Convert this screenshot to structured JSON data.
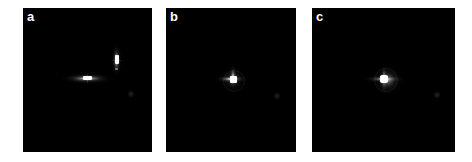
{
  "figure": {
    "kind": "multi-panel-image-figure",
    "background_color": "#ffffff",
    "panel_background_color": "#000000",
    "label_color": "#ffffff",
    "width": 472,
    "height": 162
  },
  "panels": [
    {
      "label": "a",
      "x": 23,
      "y": 8,
      "width": 129,
      "height": 144,
      "description": "Dark field with two separated bright diffraction features: a horizontal streak left-of-center and a vertical streak above-right of it",
      "features": [
        {
          "name": "horizontal-streak",
          "cx": 87,
          "cy": 78,
          "length": 52,
          "thickness": 5,
          "orientation": "horizontal",
          "peak_brightness": 1.0
        },
        {
          "name": "horizontal-streak-core",
          "cx": 88,
          "cy": 78,
          "width": 9,
          "height": 4
        },
        {
          "name": "vertical-streak",
          "cx": 116,
          "cy": 60,
          "length": 34,
          "thickness": 5,
          "orientation": "vertical",
          "peak_brightness": 1.0
        },
        {
          "name": "vertical-streak-core",
          "cx": 116,
          "cy": 60,
          "width": 4,
          "height": 9
        },
        {
          "name": "faint-dot",
          "cx": 131,
          "cy": 94,
          "radius": 4,
          "peak_brightness": 0.15
        }
      ]
    },
    {
      "label": "b",
      "x": 166,
      "y": 8,
      "width": 130,
      "height": 144,
      "description": "Dark field with a single compact asymmetric bright spot near center with short cross-shaped diffraction spikes",
      "features": [
        {
          "name": "central-core",
          "cx": 233,
          "cy": 79,
          "width": 7,
          "height": 7
        },
        {
          "name": "horizontal-spike",
          "cx": 231,
          "cy": 79,
          "length": 34,
          "thickness": 4,
          "orientation": "horizontal"
        },
        {
          "name": "vertical-spike",
          "cx": 233,
          "cy": 77,
          "length": 26,
          "thickness": 4,
          "orientation": "vertical"
        },
        {
          "name": "faint-dot",
          "cx": 277,
          "cy": 96,
          "radius": 4,
          "peak_brightness": 0.12
        }
      ]
    },
    {
      "label": "c",
      "x": 312,
      "y": 8,
      "width": 143,
      "height": 144,
      "description": "Dark field with a single bright near-symmetric star-like spot at center with four-fold diffraction spikes",
      "features": [
        {
          "name": "central-core",
          "cx": 384,
          "cy": 79,
          "width": 8,
          "height": 8
        },
        {
          "name": "horizontal-spike",
          "cx": 384,
          "cy": 79,
          "length": 42,
          "thickness": 4,
          "orientation": "horizontal"
        },
        {
          "name": "vertical-spike",
          "cx": 384,
          "cy": 77,
          "length": 30,
          "thickness": 4,
          "orientation": "vertical"
        },
        {
          "name": "central-glow",
          "cx": 384,
          "cy": 79,
          "radius": 11
        },
        {
          "name": "faint-dot",
          "cx": 437,
          "cy": 95,
          "radius": 4,
          "peak_brightness": 0.12
        }
      ]
    }
  ]
}
